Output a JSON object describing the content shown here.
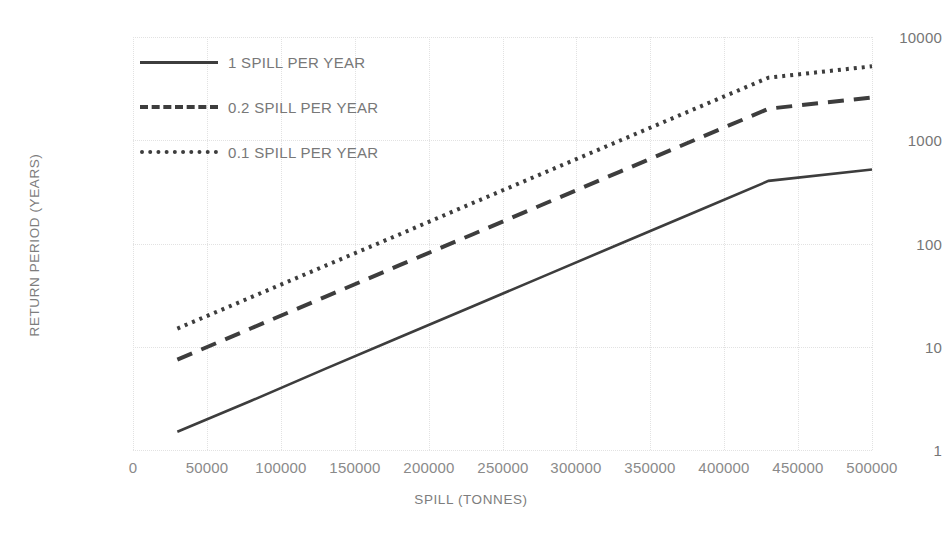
{
  "chart_data": {
    "type": "line",
    "title": "",
    "xlabel": "SPILL (TONNES)",
    "ylabel": "RETURN PERIOD (YEARS)",
    "yscale": "log",
    "xscale": "linear",
    "xlim": [
      0,
      500000
    ],
    "ylim": [
      1,
      10000
    ],
    "grid": true,
    "legend_position": "upper-left-inside",
    "xticks": [
      "0",
      "50000",
      "100000",
      "150000",
      "200000",
      "250000",
      "300000",
      "350000",
      "400000",
      "450000",
      "500000"
    ],
    "xtick_values": [
      0,
      50000,
      100000,
      150000,
      200000,
      250000,
      300000,
      350000,
      400000,
      450000,
      500000
    ],
    "yticks": [
      "1",
      "10",
      "100",
      "1000",
      "10000"
    ],
    "ytick_values": [
      1,
      10,
      100,
      1000,
      10000
    ],
    "series": [
      {
        "name": "1 SPILL PER YEAR",
        "style": "solid",
        "color": "#3d3d3d",
        "x": [
          30000,
          80000,
          130000,
          180000,
          230000,
          280000,
          330000,
          380000,
          430000,
          500000
        ],
        "values": [
          1.5,
          3.0,
          6.1,
          12.3,
          24.7,
          49.7,
          100,
          201,
          404,
          520
        ]
      },
      {
        "name": "0.2 SPILL PER YEAR",
        "style": "dashed",
        "color": "#3d3d3d",
        "x": [
          30000,
          80000,
          130000,
          180000,
          230000,
          280000,
          330000,
          380000,
          430000,
          500000
        ],
        "values": [
          7.5,
          15.1,
          30.4,
          61.3,
          123,
          248,
          500,
          1006,
          2020,
          2600
        ]
      },
      {
        "name": "0.1 SPILL PER YEAR",
        "style": "dotted",
        "color": "#3d3d3d",
        "x": [
          30000,
          80000,
          130000,
          180000,
          230000,
          280000,
          330000,
          380000,
          430000,
          500000
        ],
        "values": [
          15.0,
          30.2,
          60.8,
          122,
          247,
          497,
          1000,
          2012,
          4040,
          5200
        ]
      }
    ],
    "colors": {
      "line": "#3d3d3d",
      "grid": "#e2e2e2",
      "tick_text": "#8a8a8a",
      "axis_title": "#7d7d7d",
      "background": "#ffffff"
    }
  },
  "legend": {
    "items": [
      {
        "label": "1 SPILL PER YEAR",
        "style": "solid"
      },
      {
        "label": "0.2 SPILL PER YEAR",
        "style": "dashed"
      },
      {
        "label": "0.1 SPILL PER YEAR",
        "style": "dotted"
      }
    ]
  },
  "axes": {
    "x_title": "SPILL (TONNES)",
    "y_title": "RETURN PERIOD (YEARS)",
    "x_labels": [
      "0",
      "50000",
      "100000",
      "150000",
      "200000",
      "250000",
      "300000",
      "350000",
      "400000",
      "450000",
      "500000"
    ],
    "y_labels": [
      "10000",
      "1000",
      "100",
      "10",
      "1"
    ]
  }
}
